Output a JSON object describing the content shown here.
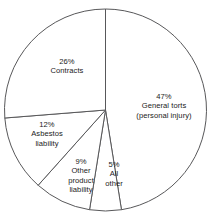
{
  "chart_data": {
    "type": "pie",
    "title": "",
    "subtitle": "",
    "xlabel": "",
    "ylabel": "",
    "legend_position": "none",
    "grid": false,
    "units": "percent",
    "start_angle_deg": 0,
    "direction": "clockwise",
    "categories": [
      "General torts (personal injury)",
      "All other",
      "Other product liability",
      "Asbestos liability",
      "Contracts"
    ],
    "values": [
      47,
      5,
      9,
      12,
      26
    ],
    "slices": [
      {
        "id": "general-torts",
        "percent_text": "47%",
        "value": 47,
        "label_line1": "General torts",
        "label_line2": "(personal injury)",
        "label_full": "General torts (personal injury)",
        "fill": "#ffffff",
        "stroke": "#58585a"
      },
      {
        "id": "all-other",
        "percent_text": "5%",
        "value": 5,
        "label_line1": "All",
        "label_line2": "other",
        "label_full": "All other",
        "fill": "#ffffff",
        "stroke": "#58585a"
      },
      {
        "id": "other-product-liability",
        "percent_text": "9%",
        "value": 9,
        "label_line1": "Other",
        "label_line2": "product",
        "label_line3": "liability",
        "label_full": "Other product liability",
        "fill": "#ffffff",
        "stroke": "#58585a"
      },
      {
        "id": "asbestos-liability",
        "percent_text": "12%",
        "value": 12,
        "label_line1": "Asbestos",
        "label_line2": "liability",
        "label_full": "Asbestos liability",
        "fill": "#ffffff",
        "stroke": "#58585a"
      },
      {
        "id": "contracts",
        "percent_text": "26%",
        "value": 26,
        "label_line1": "Contracts",
        "label_full": "Contracts",
        "fill": "#ffffff",
        "stroke": "#58585a"
      }
    ],
    "colors": {
      "background": "#ffffff",
      "slice_fill": "#ffffff",
      "outline": "#58585a",
      "text": "#1b1b1b"
    }
  }
}
